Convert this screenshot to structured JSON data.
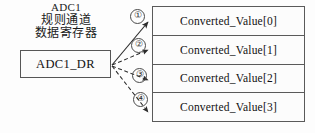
{
  "diagram": {
    "title_lines": {
      "line1": "ADC1",
      "line2": "规则通道",
      "line3": "数据寄存器"
    },
    "register": {
      "label": "ADC1_DR"
    },
    "steps": [
      {
        "marker": "①"
      },
      {
        "marker": "②"
      },
      {
        "marker": "③"
      },
      {
        "marker": "④"
      }
    ],
    "buffer": {
      "rows": [
        {
          "label": "Converted_Value[0]"
        },
        {
          "label": "Converted_Value[1]"
        },
        {
          "label": "Converted_Value[2]"
        },
        {
          "label": "Converted_Value[3]"
        }
      ]
    },
    "colors": {
      "stroke": "#555555",
      "text": "#111111",
      "background": "#fdfdfd"
    }
  }
}
